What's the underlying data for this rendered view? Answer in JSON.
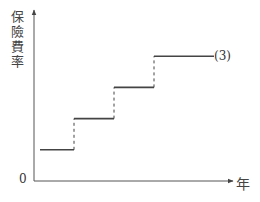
{
  "chart_data": {
    "type": "line",
    "subtype": "step",
    "title": "",
    "xlabel": "年",
    "ylabel": "保險費率",
    "origin_label": "0",
    "x_ticks": [],
    "y_ticks": [],
    "grid": false,
    "legend": null,
    "series": [
      {
        "name": "保險費率",
        "style": "solid horizontal segments joined by dashed vertical risers",
        "steps": [
          {
            "x_start": 0.3,
            "x_end": 2.0,
            "y": 1
          },
          {
            "x_start": 2.0,
            "x_end": 4.0,
            "y": 2
          },
          {
            "x_start": 4.0,
            "x_end": 6.0,
            "y": 3
          },
          {
            "x_start": 6.0,
            "x_end": 9.0,
            "y": 4
          }
        ]
      }
    ],
    "annotations": [
      {
        "text": "(3)",
        "position": "right end of top step"
      }
    ],
    "xlim": [
      0,
      10
    ],
    "ylim": [
      0,
      5
    ]
  },
  "labels": {
    "ylabel": "保險費率",
    "xlabel": "年",
    "origin": "0",
    "annotation": "(3)"
  },
  "colors": {
    "axis": "#555555",
    "line": "#444444",
    "text": "#333333"
  }
}
